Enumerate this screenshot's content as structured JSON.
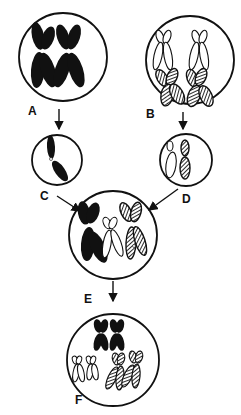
{
  "diagram": {
    "type": "chromosome-cell-fusion",
    "colors": {
      "ink": "#111111",
      "background": "#ffffff"
    },
    "cells": [
      {
        "id": "A",
        "label": "A",
        "content": "two solid black X-shaped chromosomes"
      },
      {
        "id": "B",
        "label": "B",
        "content": "two outlined X chromosomes above two hatched X chromosomes"
      },
      {
        "id": "C",
        "label": "C",
        "content": "one solid black single-chromatid chromosome"
      },
      {
        "id": "D",
        "label": "D",
        "content": "one outlined and one hatched single-chromatid chromosome"
      },
      {
        "id": "E",
        "label": "E",
        "content": "solid black, outlined, and hatched chromosomes combined"
      },
      {
        "id": "F",
        "label": "F",
        "content": "two solid black X chromosomes, two outlined X, two hatched X"
      }
    ],
    "arrows": [
      {
        "from": "A",
        "to": "C"
      },
      {
        "from": "B",
        "to": "D"
      },
      {
        "from": "C",
        "to": "E"
      },
      {
        "from": "D",
        "to": "E"
      },
      {
        "from": "E",
        "to": "F"
      }
    ]
  }
}
